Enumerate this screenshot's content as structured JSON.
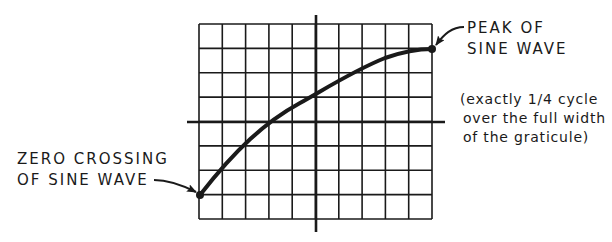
{
  "diagram": {
    "type": "oscilloscope-graticule",
    "grid": {
      "columns": 10,
      "rows": 8,
      "left": 199,
      "top": 24,
      "right": 432,
      "bottom": 219
    },
    "axes": {
      "vertical_x": 317,
      "vertical_y1": 15,
      "vertical_y2": 232,
      "horizontal_y": 123,
      "horizontal_x1": 187,
      "horizontal_x2": 445
    },
    "curve": {
      "description": "quarter cycle of sine wave from zero crossing to peak",
      "start": {
        "x": 200,
        "y": 195
      },
      "end": {
        "x": 432,
        "y": 49
      }
    },
    "colors": {
      "ink": "#1a1a1a",
      "background": "#ffffff"
    }
  },
  "labels": {
    "peak": {
      "line1": "PEAK OF",
      "line2": "SINE WAVE"
    },
    "note": {
      "line1": "(exactly 1/4 cycle",
      "line2": "over the full width",
      "line3": "of the graticule)"
    },
    "zero_crossing": {
      "line1": "ZERO CROSSING",
      "line2": "OF SINE WAVE"
    }
  }
}
